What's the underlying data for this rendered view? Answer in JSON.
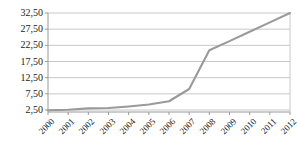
{
  "chart_data": {
    "type": "line",
    "title": "",
    "subtitle": "",
    "xlabel": "",
    "ylabel": "",
    "categories": [
      "2000",
      "2001",
      "2002",
      "2003",
      "2004",
      "2005",
      "2006",
      "2007",
      "2008",
      "2009",
      "2010",
      "2011",
      "2012"
    ],
    "values": [
      2.4,
      2.6,
      3.0,
      3.1,
      3.6,
      4.2,
      5.2,
      9.0,
      21.0,
      23.8,
      26.7,
      29.6,
      32.5
    ],
    "series": [
      {
        "name": "",
        "values": [
          2.4,
          2.6,
          3.0,
          3.1,
          3.6,
          4.2,
          5.2,
          9.0,
          21.0,
          23.8,
          26.7,
          29.6,
          32.5
        ],
        "color": "#9a9a9a"
      }
    ],
    "ylim": [
      0.0,
      35.0
    ],
    "yticks": [
      2.5,
      7.5,
      12.5,
      17.5,
      22.5,
      27.5,
      32.5
    ],
    "ytick_labels": [
      "2,50",
      "7,50",
      "12,50",
      "17,50",
      "22,50",
      "27,50",
      "32,50"
    ],
    "xtick_labels": [
      "2000",
      "2001",
      "2002",
      "2003",
      "2004",
      "2005",
      "2006",
      "2007",
      "2008",
      "2009",
      "2010",
      "2011",
      "2012"
    ],
    "grid": true,
    "grid_axis": "y",
    "legend": false,
    "legend_position": "none",
    "annotations": [],
    "colors": {
      "line": "#9a9a9a",
      "grid": "#c8c8c8",
      "axis": "#9a9a9a",
      "text": "#1a1a1a",
      "background": "#ffffff"
    }
  }
}
